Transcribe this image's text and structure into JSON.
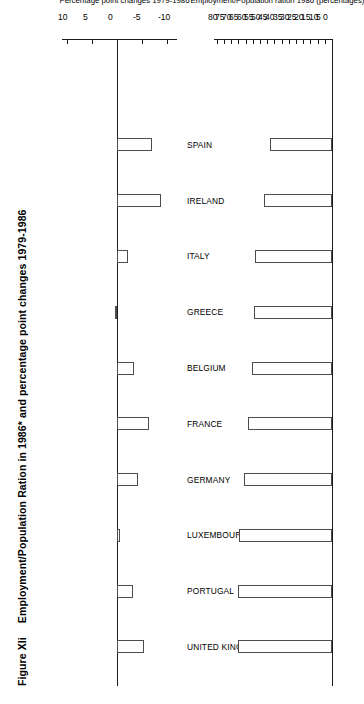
{
  "figure": {
    "number": "Figure XIi",
    "title": "Employment/Population Ration in 1986* and percentage point changes 1979-1986"
  },
  "chart_data": {
    "type": "bar",
    "title": "Employment/Population Ration in 1986* and percentage point changes 1979-1986",
    "orientation": "vertical",
    "categories": [
      "UNITED KINGDOM",
      "PORTUGAL",
      "LUXEMBOURG",
      "GERMANY",
      "FRANCE",
      "BELGIUM",
      "GREECE",
      "ITALY",
      "IRELAND",
      "SPAIN"
    ],
    "panels": [
      {
        "name": "percentage-point-changes",
        "xlabel": "",
        "ylabel": "Percentage point changes 1979-1986",
        "ylim": [
          -12,
          11
        ],
        "ticks": [
          -10,
          -5,
          0,
          5,
          10
        ],
        "tick_labels": [
          "-10",
          "-5",
          "0",
          "5",
          "10"
        ],
        "grid": false,
        "values": [
          -5.4,
          -3.1,
          -0.5,
          -4.2,
          -6.3,
          -3.4,
          0.4,
          -2.1,
          -8.8,
          -6.9
        ]
      },
      {
        "name": "employment-population-ratio-1986",
        "xlabel": "",
        "ylabel": "Employment/Population ration 1986 (percentages)",
        "ylim": [
          0,
          82
        ],
        "ticks": [
          0,
          5,
          10,
          15,
          20,
          25,
          30,
          35,
          40,
          45,
          50,
          55,
          60,
          65,
          70,
          75,
          80
        ],
        "tick_labels": [
          "0",
          "5",
          "10",
          "15",
          "20",
          "25",
          "30",
          "35",
          "40",
          "45",
          "50",
          "55",
          "60",
          "65",
          "70",
          "75",
          "80"
        ],
        "grid": false,
        "values": [
          65.5,
          65.0,
          64.5,
          61.5,
          58.5,
          55.5,
          54.5,
          53.5,
          47.0,
          43.0
        ]
      }
    ]
  }
}
